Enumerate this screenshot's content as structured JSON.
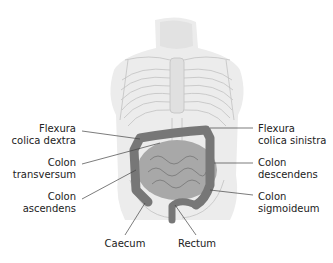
{
  "figure": {
    "colors": {
      "background": "#ffffff",
      "skin": "#e6e6e6",
      "skeleton": "#bdbdbd",
      "colon": "#7a7a7a",
      "small_intestine": "#9a9a9a",
      "leader_line": "#444444",
      "text": "#222222"
    }
  },
  "labels": {
    "flexura_dextra": {
      "line1": "Flexura",
      "line2": "colica dextra"
    },
    "colon_transversum": {
      "line1": "Colon",
      "line2": "transversum"
    },
    "colon_ascendens": {
      "line1": "Colon",
      "line2": "ascendens"
    },
    "caecum": {
      "line1": "Caecum"
    },
    "rectum": {
      "line1": "Rectum"
    },
    "flexura_sinistra": {
      "line1": "Flexura",
      "line2": "colica sinistra"
    },
    "colon_descendens": {
      "line1": "Colon",
      "line2": "descendens"
    },
    "colon_sigmoideum": {
      "line1": "Colon",
      "line2": "sigmoideum"
    }
  }
}
